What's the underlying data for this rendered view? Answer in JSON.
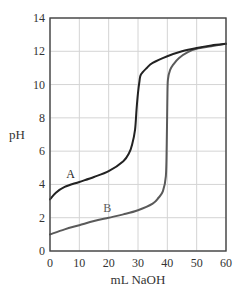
{
  "chart_data": {
    "type": "line",
    "title": "",
    "xlabel": "mL NaOH",
    "ylabel": "pH",
    "xlim": [
      0,
      60
    ],
    "ylim": [
      0,
      14
    ],
    "xticks": [
      0,
      10,
      20,
      30,
      40,
      50,
      60
    ],
    "yticks": [
      0,
      2,
      4,
      6,
      8,
      10,
      12,
      14
    ],
    "grid": true,
    "legend": "inline labels",
    "series": [
      {
        "name": "A",
        "color": "#222222",
        "x": [
          0,
          2,
          5,
          10,
          15,
          20,
          25,
          27,
          28,
          29,
          29.5,
          30,
          30.5,
          31,
          33,
          35,
          40,
          45,
          50,
          55,
          60
        ],
        "y": [
          3.1,
          3.5,
          3.85,
          4.15,
          4.45,
          4.8,
          5.4,
          5.9,
          6.4,
          7.3,
          8.5,
          9.5,
          10.2,
          10.6,
          11.0,
          11.3,
          11.7,
          12.0,
          12.2,
          12.35,
          12.45
        ]
      },
      {
        "name": "B",
        "color": "#5a5a5a",
        "x": [
          0,
          5,
          10,
          15,
          20,
          25,
          30,
          35,
          37,
          38.5,
          39.5,
          39.8,
          40,
          40.2,
          41,
          42,
          44,
          47,
          50,
          55,
          60
        ],
        "y": [
          1.0,
          1.3,
          1.55,
          1.8,
          2.0,
          2.2,
          2.45,
          2.85,
          3.2,
          3.6,
          4.5,
          6.5,
          9.0,
          10.3,
          10.9,
          11.2,
          11.6,
          11.95,
          12.15,
          12.3,
          12.45
        ]
      }
    ],
    "annotations": [
      {
        "text": "A",
        "x": 7,
        "y": 4.4
      },
      {
        "text": "B",
        "x": 19.5,
        "y": 2.35
      }
    ]
  },
  "labels": {
    "x_axis": "mL NaOH",
    "y_axis": "pH",
    "curve_a": "A",
    "curve_b": "B"
  }
}
